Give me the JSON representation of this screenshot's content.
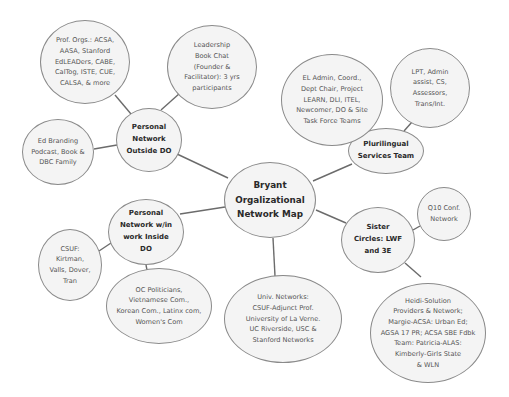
{
  "diagram": {
    "title": "Bryant Orgalizational Network Map",
    "colors": {
      "background": "#ffffff",
      "node_fill": "#f4f4f4",
      "node_border": "#8a8a8a",
      "edge": "#6b6b6b",
      "hub_text": "#2a2a2a",
      "leaf_text": "#555555"
    },
    "root": {
      "id": "root",
      "label": "Bryant\nOrgalizational\nNetwork Map",
      "cx": 270,
      "cy": 200,
      "rx": 46,
      "ry": 38
    },
    "hubs": [
      {
        "id": "personal-outside",
        "label": "Personal\nNetwork\nOutside DO",
        "cx": 149,
        "cy": 140,
        "rx": 33,
        "ry": 32
      },
      {
        "id": "personal-inside",
        "label": "Personal\nNetwork w/in\nwork Inside\nDO",
        "cx": 146,
        "cy": 232,
        "rx": 38,
        "ry": 33
      },
      {
        "id": "plurilingual",
        "label": "Plurilingual\nServices Team",
        "cx": 386,
        "cy": 151,
        "rx": 38,
        "ry": 23
      },
      {
        "id": "sister-circles",
        "label": "Sister\nCircles: LWF\nand 3E",
        "cx": 378,
        "cy": 240,
        "rx": 37,
        "ry": 33
      }
    ],
    "leaves": [
      {
        "id": "prof-orgs",
        "parent": "personal-outside",
        "label": "Prof. Orgs.: ACSA,\nAASA, Stanford\nEdLEADers, CABE,\nCalTog, ISTE, CUE,\nCALSA, & more",
        "cx": 85,
        "cy": 62,
        "rx": 45,
        "ry": 42
      },
      {
        "id": "book-chat",
        "parent": "personal-outside",
        "label": "Leadership\nBook Chat\n(Founder &\nFacilitator): 3 yrs\nparticipants",
        "cx": 212,
        "cy": 67,
        "rx": 45,
        "ry": 42
      },
      {
        "id": "ed-branding",
        "parent": "personal-outside",
        "label": "Ed Branding\nPodcast, Book &\nDBC Family",
        "cx": 58,
        "cy": 152,
        "rx": 36,
        "ry": 33
      },
      {
        "id": "csuf",
        "parent": "personal-inside",
        "label": "CSUF:\nKirtman,\nValls, Dover,\nTran",
        "cx": 70,
        "cy": 265,
        "rx": 32,
        "ry": 36
      },
      {
        "id": "oc-politicians",
        "parent": "personal-inside",
        "label": "OC Politicians,\nVietnamese Com.,\nKorean Com., Latinx com,\nWomen's Com",
        "cx": 159,
        "cy": 306,
        "rx": 53,
        "ry": 38
      },
      {
        "id": "univ-networks",
        "parent": "root",
        "label": "Univ. Networks:\nCSUF-Adjunct Prof.\nUniversity of La Verne.\nUC Riverside, USC &\nStanford Networks",
        "cx": 283,
        "cy": 319,
        "rx": 59,
        "ry": 44
      },
      {
        "id": "el-admin",
        "parent": "plurilingual",
        "label": "EL Admin, Coord.,\nDept Chair, Project\nLEARN, DLI, ITEL,\nNewcomer, DO & Site\nTask Force Teams",
        "cx": 332,
        "cy": 100,
        "rx": 51,
        "ry": 46
      },
      {
        "id": "lpt",
        "parent": "plurilingual",
        "label": "LPT, Admin\nassist, CS,\nAssessors,\nTrans/Int.",
        "cx": 430,
        "cy": 88,
        "rx": 40,
        "ry": 40
      },
      {
        "id": "q10",
        "parent": "sister-circles",
        "label": "Q10 Conf.\nNetwork",
        "cx": 444,
        "cy": 214,
        "rx": 27,
        "ry": 27
      },
      {
        "id": "heidi",
        "parent": "sister-circles",
        "label": "Heidi-Solution\nProviders & Network;\nMargie-ACSA: Urban Ed;\nAGSA 17 PR; ACSA SBE Fdbk\nTeam: Patricia-ALAS:\nKimberly-Girls State\n& WLN",
        "cx": 428,
        "cy": 333,
        "rx": 58,
        "ry": 50
      }
    ],
    "edges": [
      {
        "from": "root",
        "to": "personal-outside",
        "x1": 228,
        "y1": 178,
        "x2": 177,
        "y2": 154
      },
      {
        "from": "root",
        "to": "personal-inside",
        "x1": 225,
        "y1": 207,
        "x2": 180,
        "y2": 214
      },
      {
        "from": "root",
        "to": "plurilingual",
        "x1": 313,
        "y1": 181,
        "x2": 352,
        "y2": 164
      },
      {
        "from": "root",
        "to": "sister-circles",
        "x1": 316,
        "y1": 210,
        "x2": 346,
        "y2": 223
      },
      {
        "from": "root",
        "to": "univ-networks",
        "x1": 273,
        "y1": 238,
        "x2": 275,
        "y2": 276
      },
      {
        "from": "personal-outside",
        "to": "prof-orgs",
        "x1": 131,
        "y1": 114,
        "x2": 115,
        "y2": 95
      },
      {
        "from": "personal-outside",
        "to": "book-chat",
        "x1": 161,
        "y1": 110,
        "x2": 180,
        "y2": 93
      },
      {
        "from": "personal-outside",
        "to": "ed-branding",
        "x1": 117,
        "y1": 145,
        "x2": 94,
        "y2": 149
      },
      {
        "from": "personal-inside",
        "to": "csuf",
        "x1": 111,
        "y1": 243,
        "x2": 99,
        "y2": 251
      },
      {
        "from": "personal-inside",
        "to": "oc-politicians",
        "x1": 146,
        "y1": 265,
        "x2": 147,
        "y2": 270
      },
      {
        "from": "plurilingual",
        "to": "lpt",
        "x1": 404,
        "y1": 131,
        "x2": 412,
        "y2": 122
      },
      {
        "from": "sister-circles",
        "to": "q10",
        "x1": 413,
        "y1": 230,
        "x2": 420,
        "y2": 226
      },
      {
        "from": "sister-circles",
        "to": "heidi",
        "x1": 405,
        "y1": 263,
        "x2": 421,
        "y2": 277
      }
    ]
  }
}
